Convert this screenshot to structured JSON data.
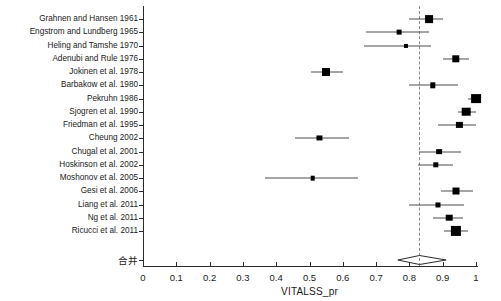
{
  "chart_data": {
    "type": "scatter",
    "title": "",
    "xlabel": "VITALSS_pr",
    "ylabel": "",
    "xlim": [
      0,
      1
    ],
    "xticks": [
      "0",
      "0.1",
      "0.2",
      "0.3",
      "0.4",
      "0.5",
      "0.6",
      "0.7",
      "0.8",
      "0.9",
      "1"
    ],
    "xtick_values": [
      0,
      0.1,
      0.2,
      0.3,
      0.4,
      0.5,
      0.6,
      0.7,
      0.8,
      0.9,
      1.0
    ],
    "grid": false,
    "legend": "none",
    "reference_line": 0.83,
    "plot_style": "forest-plot",
    "studies": [
      {
        "label": "Grahnen and Hansen 1961",
        "estimate": 0.86,
        "ci_low": 0.8,
        "ci_high": 0.9,
        "weight": 0.6
      },
      {
        "label": "Engstrom and Lundberg 1965",
        "estimate": 0.77,
        "ci_low": 0.67,
        "ci_high": 0.86,
        "weight": 0.22
      },
      {
        "label": "Heling and Tamshe 1970",
        "estimate": 0.79,
        "ci_low": 0.665,
        "ci_high": 0.865,
        "weight": 0.14
      },
      {
        "label": "Adenubi and Rule 1976",
        "estimate": 0.94,
        "ci_low": 0.9,
        "ci_high": 0.98,
        "weight": 0.55
      },
      {
        "label": "Jokinen et al. 1978",
        "estimate": 0.55,
        "ci_low": 0.505,
        "ci_high": 0.6,
        "weight": 0.62
      },
      {
        "label": "Barbakow et al. 1980",
        "estimate": 0.87,
        "ci_low": 0.8,
        "ci_high": 0.945,
        "weight": 0.3
      },
      {
        "label": "Pekruhn 1986",
        "estimate": 1.0,
        "ci_low": 0.975,
        "ci_high": 1.0,
        "weight": 0.85
      },
      {
        "label": "Sjogren et al. 1990",
        "estimate": 0.97,
        "ci_low": 0.945,
        "ci_high": 1.0,
        "weight": 0.7
      },
      {
        "label": "Friedman et al. 1995",
        "estimate": 0.95,
        "ci_low": 0.885,
        "ci_high": 1.0,
        "weight": 0.4
      },
      {
        "label": "Cheung 2002",
        "estimate": 0.53,
        "ci_low": 0.455,
        "ci_high": 0.62,
        "weight": 0.26
      },
      {
        "label": "Chugal et al. 2001",
        "estimate": 0.89,
        "ci_low": 0.83,
        "ci_high": 0.955,
        "weight": 0.34
      },
      {
        "label": "Hoskinson et al. 2002",
        "estimate": 0.88,
        "ci_low": 0.825,
        "ci_high": 0.93,
        "weight": 0.3
      },
      {
        "label": "Moshonov et al. 2005",
        "estimate": 0.51,
        "ci_low": 0.365,
        "ci_high": 0.645,
        "weight": 0.2
      },
      {
        "label": "Gesi et al. 2006",
        "estimate": 0.94,
        "ci_low": 0.895,
        "ci_high": 0.99,
        "weight": 0.5
      },
      {
        "label": "Liang et al. 2011",
        "estimate": 0.885,
        "ci_low": 0.8,
        "ci_high": 0.965,
        "weight": 0.26
      },
      {
        "label": "Ng et al. 2011",
        "estimate": 0.92,
        "ci_low": 0.87,
        "ci_high": 0.96,
        "weight": 0.45
      },
      {
        "label": "Ricucci et al. 2011",
        "estimate": 0.94,
        "ci_low": 0.905,
        "ci_high": 0.975,
        "weight": 0.9
      }
    ],
    "pooled": {
      "label": "合并",
      "estimate": 0.83,
      "ci_low": 0.765,
      "ci_high": 0.91
    }
  },
  "colors": {
    "marker": "#000000",
    "line": "#4d4d4d",
    "axis": "#2b2b2b",
    "reference": "#888888",
    "text": "#1a1a1a",
    "background": "#ffffff"
  }
}
